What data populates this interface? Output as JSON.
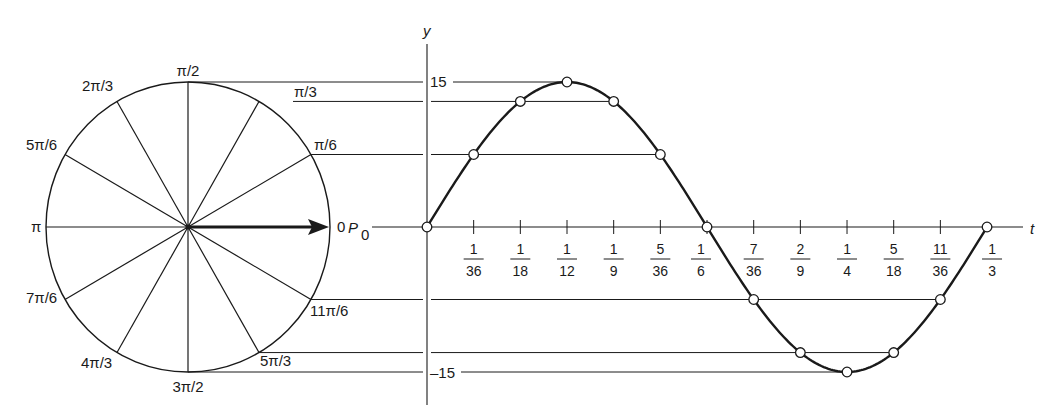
{
  "colors": {
    "ink": "#1a1a1a",
    "thin": "#2a2a2a",
    "background": "#ffffff"
  },
  "circle": {
    "angle_labels": [
      {
        "angle_deg": 0,
        "label": "0"
      },
      {
        "angle_deg": 30,
        "label": "π/6"
      },
      {
        "angle_deg": 60,
        "label": "π/3"
      },
      {
        "angle_deg": 90,
        "label": "π/2"
      },
      {
        "angle_deg": 120,
        "label": "2π/3"
      },
      {
        "angle_deg": 150,
        "label": "5π/6"
      },
      {
        "angle_deg": 180,
        "label": "π"
      },
      {
        "angle_deg": 210,
        "label": "7π/6"
      },
      {
        "angle_deg": 240,
        "label": "4π/3"
      },
      {
        "angle_deg": 270,
        "label": "3π/2"
      },
      {
        "angle_deg": 300,
        "label": "5π/3"
      },
      {
        "angle_deg": 330,
        "label": "11π/6"
      }
    ],
    "phasor_label": "P",
    "phasor_subscript": "0"
  },
  "graph": {
    "y_axis_label": "y",
    "t_axis_label": "t",
    "y_max_label": "15",
    "y_min_label": "–15",
    "amplitude": 15,
    "period": "1/3",
    "t_ticks": [
      {
        "num": "1",
        "den": "36"
      },
      {
        "num": "1",
        "den": "18"
      },
      {
        "num": "1",
        "den": "12"
      },
      {
        "num": "1",
        "den": "9"
      },
      {
        "num": "5",
        "den": "36"
      },
      {
        "num": "1",
        "den": "6"
      },
      {
        "num": "7",
        "den": "36"
      },
      {
        "num": "2",
        "den": "9"
      },
      {
        "num": "1",
        "den": "4"
      },
      {
        "num": "5",
        "den": "18"
      },
      {
        "num": "11",
        "den": "36"
      },
      {
        "num": "1",
        "den": "3"
      }
    ],
    "curve_equation": "y = 15 sin(6πt)",
    "sample_points_t_in_36ths": [
      0,
      1,
      2,
      3,
      4,
      5,
      6,
      7,
      8,
      9,
      10,
      11,
      12
    ]
  }
}
